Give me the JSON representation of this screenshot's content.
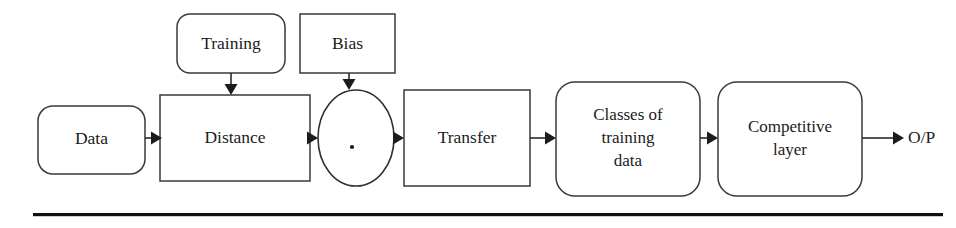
{
  "diagram": {
    "background_color": "#ffffff",
    "stroke_color": "#2b2b2b",
    "text_color": "#1b1b1b",
    "nodes": {
      "training": {
        "label": "Training",
        "shape": "rounded-rectangle"
      },
      "bias": {
        "label": "Bias",
        "shape": "rectangle"
      },
      "data": {
        "label": "Data",
        "shape": "rounded-rectangle"
      },
      "distance": {
        "label": "Distance",
        "shape": "rectangle"
      },
      "product": {
        "label": "·",
        "shape": "ellipse"
      },
      "transfer": {
        "label": "Transfer",
        "shape": "rectangle"
      },
      "classes": {
        "shape": "rounded-rectangle",
        "line1": "Classes of",
        "line2": "training",
        "line3": "data"
      },
      "competitive": {
        "shape": "rounded-rectangle",
        "line1": "Competitive",
        "line2": "layer"
      },
      "output": {
        "label": "O/P",
        "shape": "text"
      }
    },
    "edges": [
      {
        "from": "data",
        "to": "distance",
        "direction": "right"
      },
      {
        "from": "training",
        "to": "distance",
        "direction": "down"
      },
      {
        "from": "distance",
        "to": "product",
        "direction": "right"
      },
      {
        "from": "bias",
        "to": "product",
        "direction": "down"
      },
      {
        "from": "product",
        "to": "transfer",
        "direction": "right"
      },
      {
        "from": "transfer",
        "to": "classes",
        "direction": "right"
      },
      {
        "from": "classes",
        "to": "competitive",
        "direction": "right"
      },
      {
        "from": "competitive",
        "to": "output",
        "direction": "right"
      }
    ],
    "footer_rule": {
      "color": "#111111"
    }
  }
}
